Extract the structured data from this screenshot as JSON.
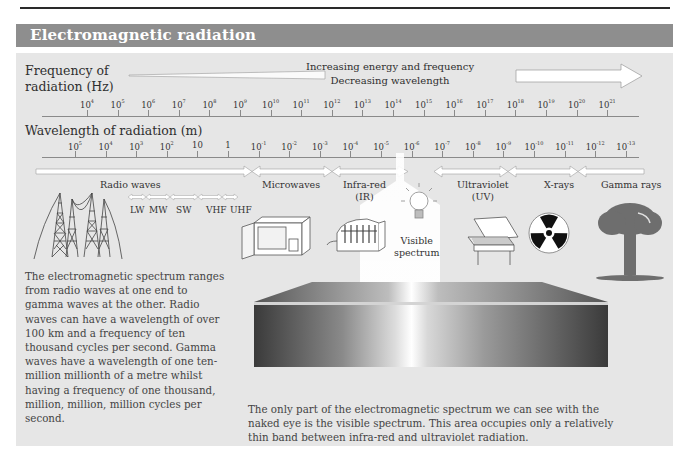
{
  "header": {
    "title": "Electromagnetic radiation"
  },
  "frequency_axis": {
    "label_line1": "Frequency of",
    "label_line2": "radiation (Hz)",
    "direction_line1": "Increasing energy and frequency",
    "direction_line2": "Decreasing wavelength",
    "ticks": [
      {
        "base": "10",
        "exp": "4"
      },
      {
        "base": "10",
        "exp": "5"
      },
      {
        "base": "10",
        "exp": "6"
      },
      {
        "base": "10",
        "exp": "7"
      },
      {
        "base": "10",
        "exp": "8"
      },
      {
        "base": "10",
        "exp": "9"
      },
      {
        "base": "10",
        "exp": "10"
      },
      {
        "base": "10",
        "exp": "11"
      },
      {
        "base": "10",
        "exp": "12"
      },
      {
        "base": "10",
        "exp": "13"
      },
      {
        "base": "10",
        "exp": "14"
      },
      {
        "base": "10",
        "exp": "15"
      },
      {
        "base": "10",
        "exp": "16"
      },
      {
        "base": "10",
        "exp": "17"
      },
      {
        "base": "10",
        "exp": "18"
      },
      {
        "base": "10",
        "exp": "19"
      },
      {
        "base": "10",
        "exp": "20"
      },
      {
        "base": "10",
        "exp": "21"
      }
    ]
  },
  "wavelength_axis": {
    "label": "Wavelength of radiation (m)",
    "ticks": [
      {
        "base": "10",
        "exp": "5"
      },
      {
        "base": "10",
        "exp": "4"
      },
      {
        "base": "10",
        "exp": "3"
      },
      {
        "base": "10",
        "exp": "2"
      },
      {
        "base": "10",
        "exp": ""
      },
      {
        "base": "1",
        "exp": ""
      },
      {
        "base": "10",
        "exp": "-1"
      },
      {
        "base": "10",
        "exp": "-2"
      },
      {
        "base": "10",
        "exp": "-3"
      },
      {
        "base": "10",
        "exp": "-4"
      },
      {
        "base": "10",
        "exp": "-5"
      },
      {
        "base": "10",
        "exp": "-6"
      },
      {
        "base": "10",
        "exp": "-7"
      },
      {
        "base": "10",
        "exp": "-8"
      },
      {
        "base": "10",
        "exp": "-9"
      },
      {
        "base": "10",
        "exp": "-10"
      },
      {
        "base": "10",
        "exp": "-11"
      },
      {
        "base": "10",
        "exp": "-12"
      },
      {
        "base": "10",
        "exp": "-13"
      }
    ]
  },
  "bands": {
    "radio": "Radio waves",
    "microwaves": "Microwaves",
    "infrared_line1": "Infra-red",
    "infrared_line2": "(IR)",
    "visible_line1": "Visible",
    "visible_line2": "spectrum",
    "ultraviolet_line1": "Ultraviolet",
    "ultraviolet_line2": "(UV)",
    "xrays": "X-rays",
    "gamma": "Gamma rays"
  },
  "radio_subbands": [
    "LW",
    "MW",
    "SW",
    "VHF",
    "UHF"
  ],
  "icons": {
    "radio": "radio-tower-icon",
    "microwave": "microwave-oven-icon",
    "infrared": "heater-icon",
    "visible": "light-bulb-icon",
    "ultraviolet": "sunbed-icon",
    "xrays": "radiation-symbol-icon",
    "gamma": "mushroom-cloud-icon"
  },
  "text": {
    "left_paragraph": "The electromagnetic spectrum ranges from radio waves at one end to gamma waves at the other. Radio waves can have a wavelength of over 100 km and a frequency of ten thousand cycles per second. Gamma waves have a wavelength of one ten-million millionth of a metre whilst having a frequency of one thousand, million, million, million cycles per second.",
    "bottom_paragraph": "The only part of the electromagnetic spectrum we can see with the naked eye is the visible spectrum. This area occupies only a relatively thin band between infra-red and ultraviolet radiation."
  },
  "colors": {
    "header_bg": "#8e8e8e",
    "panel_bg": "#e6e6e6",
    "text": "#333333"
  }
}
